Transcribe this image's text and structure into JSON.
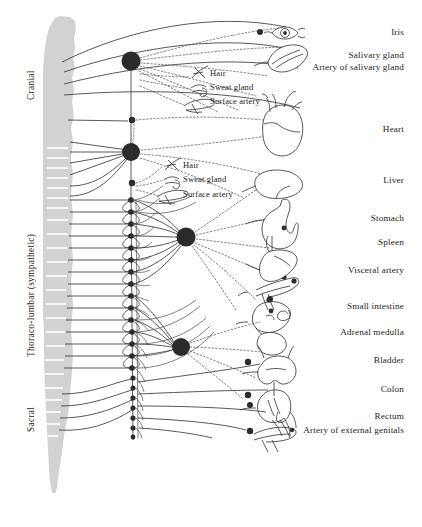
{
  "figure": {
    "width": 422,
    "height": 527,
    "background_color": "#ffffff",
    "line_color": "#3a3a3a",
    "ganglion_color": "#2b2b2b",
    "cord_color": "#cfcfcf"
  },
  "region_labels": [
    {
      "name": "cranial",
      "text": "Cranial",
      "x": 25,
      "y": 100
    },
    {
      "name": "thoraco-lumbar-sympathetic",
      "text": "Thoraco-lumbar (sympathetic)",
      "x": 25,
      "y": 357
    },
    {
      "name": "sacral",
      "text": "Sacral",
      "x": 25,
      "y": 432
    }
  ],
  "organ_labels": [
    {
      "name": "iris",
      "text": "Iris",
      "x": 404,
      "y": 33
    },
    {
      "name": "salivary-gland",
      "text": "Salivary gland",
      "x": 404,
      "y": 56
    },
    {
      "name": "artery-of-salivary-gland",
      "text": "Artery of salivary gland",
      "x": 404,
      "y": 68
    },
    {
      "name": "heart",
      "text": "Heart",
      "x": 404,
      "y": 130
    },
    {
      "name": "liver",
      "text": "Liver",
      "x": 404,
      "y": 181
    },
    {
      "name": "stomach",
      "text": "Stomach",
      "x": 404,
      "y": 219
    },
    {
      "name": "spleen",
      "text": "Spleen",
      "x": 404,
      "y": 243
    },
    {
      "name": "visceral-artery",
      "text": "Visceral artery",
      "x": 404,
      "y": 271
    },
    {
      "name": "small-intestine",
      "text": "Small intestine",
      "x": 404,
      "y": 307
    },
    {
      "name": "adrenal-medulla",
      "text": "Adrenal medulla",
      "x": 404,
      "y": 333
    },
    {
      "name": "bladder",
      "text": "Bladder",
      "x": 404,
      "y": 361
    },
    {
      "name": "colon",
      "text": "Colon",
      "x": 404,
      "y": 390
    },
    {
      "name": "rectum",
      "text": "Rectum",
      "x": 404,
      "y": 417
    },
    {
      "name": "artery-of-external-genitals",
      "text": "Artery of external genitals",
      "x": 404,
      "y": 431
    }
  ],
  "inline_labels": [
    {
      "name": "hair-upper",
      "text": "Hair",
      "x": 210,
      "y": 74
    },
    {
      "name": "sweat-gland-upper",
      "text": "Sweat gland",
      "x": 210,
      "y": 89
    },
    {
      "name": "surface-artery-upper",
      "text": "Surface artery",
      "x": 210,
      "y": 103
    },
    {
      "name": "hair-lower",
      "text": "Hair",
      "x": 183,
      "y": 166
    },
    {
      "name": "sweat-gland-lower",
      "text": "Sweat gland",
      "x": 183,
      "y": 181
    },
    {
      "name": "surface-artery-lower",
      "text": "Surface artery",
      "x": 183,
      "y": 196
    }
  ],
  "ganglia": [
    {
      "name": "superior-cervical-ganglion",
      "cx": 131,
      "cy": 61,
      "r": 9.5
    },
    {
      "name": "small-ganglion-upper",
      "cx": 131,
      "cy": 120,
      "r": 3.2
    },
    {
      "name": "stellate-ganglion",
      "cx": 131,
      "cy": 152,
      "r": 9.0
    },
    {
      "name": "small-ganglion-mid",
      "cx": 131,
      "cy": 183,
      "r": 3.2
    },
    {
      "name": "celiac-ganglion",
      "cx": 186,
      "cy": 237,
      "r": 9.5
    },
    {
      "name": "inferior-mesenteric-ganglion",
      "cx": 181,
      "cy": 347,
      "r": 9.0
    }
  ],
  "chain_ganglia_y": [
    200,
    212,
    224,
    236,
    248,
    260,
    272,
    284,
    296,
    308,
    320,
    332,
    344,
    356,
    368,
    378,
    388,
    398,
    408,
    418,
    428
  ],
  "organ_glyphs": [
    {
      "name": "iris-eye",
      "label": "Iris"
    },
    {
      "name": "salivary-gland-shape",
      "label": "Salivary gland"
    },
    {
      "name": "heart-shape",
      "label": "Heart"
    },
    {
      "name": "liver-shape",
      "label": "Liver"
    },
    {
      "name": "stomach-shape",
      "label": "Stomach"
    },
    {
      "name": "spleen-shape",
      "label": "Spleen"
    },
    {
      "name": "visceral-artery-shape",
      "label": "Visceral artery"
    },
    {
      "name": "small-intestine-shape",
      "label": "Small intestine"
    },
    {
      "name": "adrenal-medulla-shape",
      "label": "Adrenal medulla"
    },
    {
      "name": "bladder-shape",
      "label": "Bladder"
    },
    {
      "name": "colon-shape",
      "label": "Colon"
    },
    {
      "name": "rectum-shape",
      "label": "Rectum"
    },
    {
      "name": "external-genitals-artery-shape",
      "label": "Artery of external genitals"
    },
    {
      "name": "hair-glyph-upper",
      "label": "Hair"
    },
    {
      "name": "sweat-gland-glyph-upper",
      "label": "Sweat gland"
    },
    {
      "name": "surface-artery-glyph-upper",
      "label": "Surface artery"
    },
    {
      "name": "hair-glyph-lower",
      "label": "Hair"
    },
    {
      "name": "sweat-gland-glyph-lower",
      "label": "Sweat gland"
    },
    {
      "name": "surface-artery-glyph-lower",
      "label": "Surface artery"
    }
  ]
}
